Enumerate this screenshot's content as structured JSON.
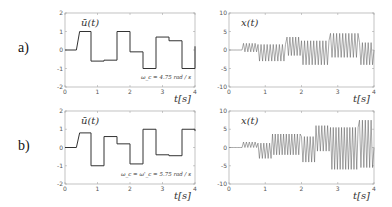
{
  "rows": [
    {
      "label": "a)"
    },
    {
      "label": "b)"
    }
  ],
  "chart_data": [
    {
      "id": "a-left",
      "type": "line",
      "title": "",
      "label": "ū(t)",
      "annotation": "ω_c = 4.75 rad / s",
      "xlabel": "t[s]",
      "ylabel": "",
      "xlim": [
        0,
        4
      ],
      "ylim": [
        -2,
        2
      ],
      "xticks": [
        "0",
        "1",
        "2",
        "3",
        "4"
      ],
      "yticks": [
        "2",
        "1",
        "0",
        "-1",
        "-2"
      ],
      "grid": false,
      "step": true,
      "x": [
        0,
        0.35,
        0.45,
        0.8,
        0.8,
        1.2,
        1.2,
        1.6,
        1.6,
        2.0,
        2.0,
        2.4,
        2.4,
        2.8,
        2.8,
        3.2,
        3.2,
        3.6,
        3.6,
        4.0,
        4.0
      ],
      "values": [
        0,
        0,
        1,
        1,
        -0.6,
        -0.6,
        -0.55,
        -0.55,
        1,
        1,
        -0.1,
        -0.1,
        -1,
        -1,
        0.7,
        0.7,
        0.5,
        0.5,
        -1,
        -1,
        0.2
      ]
    },
    {
      "id": "a-right",
      "type": "line",
      "title": "",
      "label": "x(t)",
      "xlabel": "t[s]",
      "ylabel": "",
      "xlim": [
        0,
        4
      ],
      "ylim": [
        -10,
        10
      ],
      "xticks": [
        "0",
        "1",
        "2",
        "3",
        "4"
      ],
      "yticks": [
        "10",
        "5",
        "0",
        "-5",
        "-10"
      ],
      "grid": false,
      "oscillation_envelope": [
        {
          "t0": 0.0,
          "t1": 0.4,
          "min": 0,
          "max": 0
        },
        {
          "t0": 0.4,
          "t1": 0.8,
          "min": -0.5,
          "max": 1.8
        },
        {
          "t0": 0.8,
          "t1": 1.6,
          "min": -3,
          "max": 1.5
        },
        {
          "t0": 1.6,
          "t1": 2.0,
          "min": -1.5,
          "max": 3.5
        },
        {
          "t0": 2.0,
          "t1": 2.8,
          "min": -4,
          "max": 2.5
        },
        {
          "t0": 2.8,
          "t1": 3.6,
          "min": -2,
          "max": 4.5
        },
        {
          "t0": 3.6,
          "t1": 4.0,
          "min": -4,
          "max": 2
        }
      ],
      "frequency_hz": 12
    },
    {
      "id": "b-left",
      "type": "line",
      "title": "",
      "label": "ū(t)",
      "annotation": "ω_c = ω'_c = 5.75 rad / s",
      "xlabel": "t[s]",
      "ylabel": "",
      "xlim": [
        0,
        4
      ],
      "ylim": [
        -2,
        2
      ],
      "xticks": [
        "0",
        "1",
        "2",
        "3",
        "4"
      ],
      "yticks": [
        "2",
        "1",
        "0",
        "-1",
        "-2"
      ],
      "grid": false,
      "step": true,
      "x": [
        0,
        0.35,
        0.45,
        0.8,
        0.8,
        1.2,
        1.2,
        1.6,
        1.6,
        2.0,
        2.0,
        2.4,
        2.4,
        2.8,
        2.8,
        3.2,
        3.2,
        3.6,
        3.6,
        4.0,
        4.0
      ],
      "values": [
        0,
        0,
        0.8,
        0.8,
        -1,
        -1,
        0.6,
        0.6,
        0.2,
        0.2,
        -0.9,
        -0.9,
        1,
        1,
        -0.4,
        -0.4,
        -0.45,
        -0.45,
        1,
        1,
        0.9
      ]
    },
    {
      "id": "b-right",
      "type": "line",
      "title": "",
      "label": "x(t)",
      "xlabel": "t[s]",
      "ylabel": "",
      "xlim": [
        0,
        4
      ],
      "ylim": [
        -10,
        10
      ],
      "xticks": [
        "0",
        "1",
        "2",
        "3",
        "4"
      ],
      "yticks": [
        "10",
        "5",
        "0",
        "-5",
        "-10"
      ],
      "grid": false,
      "oscillation_envelope": [
        {
          "t0": 0.0,
          "t1": 0.4,
          "min": 0,
          "max": 0
        },
        {
          "t0": 0.4,
          "t1": 0.8,
          "min": 0,
          "max": 1.5
        },
        {
          "t0": 0.8,
          "t1": 1.2,
          "min": -3,
          "max": 1.2
        },
        {
          "t0": 1.2,
          "t1": 2.0,
          "min": -2,
          "max": 3.7
        },
        {
          "t0": 2.0,
          "t1": 2.4,
          "min": -4,
          "max": 3
        },
        {
          "t0": 2.4,
          "t1": 2.8,
          "min": -1,
          "max": 6
        },
        {
          "t0": 2.8,
          "t1": 3.6,
          "min": -6,
          "max": 5.5
        },
        {
          "t0": 3.6,
          "t1": 4.0,
          "min": -5.5,
          "max": 7.5
        }
      ],
      "frequency_hz": 13
    }
  ],
  "layout": {
    "panels": [
      {
        "x": 65,
        "y": 13,
        "w": 130,
        "h": 74
      },
      {
        "x": 229,
        "y": 13,
        "w": 145,
        "h": 74
      },
      {
        "x": 65,
        "y": 111,
        "w": 130,
        "h": 73
      },
      {
        "x": 229,
        "y": 111,
        "w": 145,
        "h": 73
      }
    ],
    "row_label_pos": [
      {
        "x": 18,
        "y": 42
      },
      {
        "x": 18,
        "y": 140
      }
    ]
  },
  "colors": {
    "line": "#333333",
    "axis": "#999999",
    "tick_text": "#555555"
  }
}
